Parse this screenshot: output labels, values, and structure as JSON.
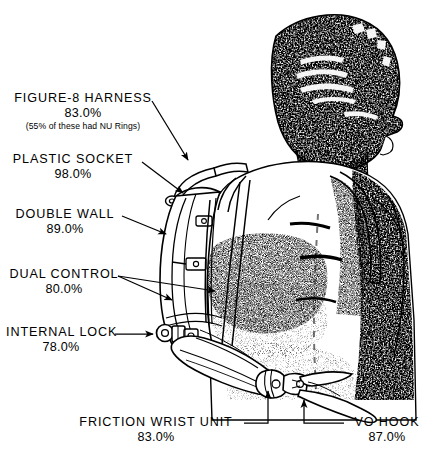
{
  "document": {
    "title": "Above-Elbow Prosthesis Component Usage Diagram",
    "background_color": "#ffffff",
    "ink_color": "#000000"
  },
  "figure": {
    "name": "halftone-photo-of-person-wearing-above-elbow-prosthesis"
  },
  "callouts": [
    {
      "id": "figure-8-harness",
      "title": "FIGURE-8 HARNESS",
      "percent": "83.0%",
      "note": "(55% of these had NU Rings)"
    },
    {
      "id": "plastic-socket",
      "title": "PLASTIC SOCKET",
      "percent": "98.0%",
      "note": ""
    },
    {
      "id": "double-wall",
      "title": "DOUBLE WALL",
      "percent": "89.0%",
      "note": ""
    },
    {
      "id": "dual-control",
      "title": "DUAL CONTROL",
      "percent": "80.0%",
      "note": ""
    },
    {
      "id": "internal-lock",
      "title": "INTERNAL LOCK",
      "percent": "78.0%",
      "note": ""
    },
    {
      "id": "friction-wrist-unit",
      "title": "FRICTION WRIST UNIT",
      "percent": "83.0%",
      "note": ""
    },
    {
      "id": "vo-hook",
      "title": "VO HOOK",
      "percent": "87.0%",
      "note": ""
    }
  ]
}
